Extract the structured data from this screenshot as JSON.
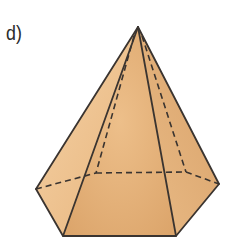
{
  "label": "d)",
  "figure": {
    "type": "hexagonal-pyramid",
    "colors": {
      "face_light": "#F2C896",
      "face_mid": "#E6B47C",
      "face_dark": "#D59D62",
      "edge": "#3A3430"
    },
    "vertices": {
      "apex": [
        138,
        27
      ],
      "base_left": [
        36,
        189
      ],
      "base_front_left": [
        63,
        236
      ],
      "base_front_right": [
        176,
        236
      ],
      "base_right": [
        219,
        184
      ],
      "base_back_right": [
        186,
        172
      ],
      "base_back_left": [
        96,
        173
      ]
    }
  }
}
